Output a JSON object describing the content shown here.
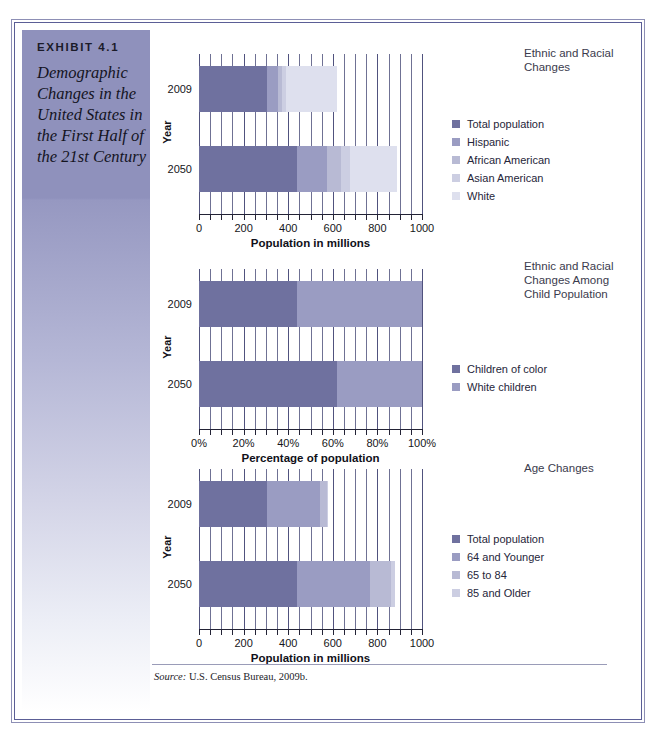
{
  "exhibit": {
    "tag": "EXHIBIT 4.1",
    "title": "Demographic Changes in the United States in the First Half of the 21st Century"
  },
  "source": {
    "prefix": "Source:",
    "text": "U.S. Census Bureau, 2009b."
  },
  "palette": {
    "total_population": "#6f719f",
    "hispanic": "#9a9cc2",
    "african_american": "#b8bad4",
    "asian_american": "#ccceE2",
    "white": "#dee0ee",
    "children_of_color": "#6f719f",
    "white_children": "#9a9cc2",
    "age_64_younger": "#9a9cc2",
    "age_65_84": "#b8bad4",
    "age_85_older": "#ccceE2",
    "frame_outer": "#8d8fb5",
    "frame_inner": "#5b5e96",
    "sidebar_top": "#8f91bc"
  },
  "chart_data": [
    {
      "id": "chart1",
      "type": "bar",
      "orientation": "horizontal",
      "stacked": true,
      "title": "Ethnic and Racial Changes",
      "xlabel": "Population in millions",
      "ylabel": "Year",
      "xlim": [
        0,
        1000
      ],
      "xticks": [
        0,
        200,
        400,
        600,
        800,
        1000
      ],
      "xtick_labels": [
        "0",
        "200",
        "400",
        "600",
        "800",
        "1000"
      ],
      "minor_tick_step": 50,
      "grid": true,
      "categories": [
        "2009",
        "2050"
      ],
      "series": [
        {
          "name": "Total population",
          "color": "#6f719f",
          "values": [
            307,
            439
          ]
        },
        {
          "name": "Hispanic",
          "color": "#9a9cc2",
          "values": [
            47,
            133
          ]
        },
        {
          "name": "African American",
          "color": "#b8bad4",
          "values": [
            20,
            65
          ]
        },
        {
          "name": "Asian American",
          "color": "#ccceE2",
          "values": [
            14,
            40
          ]
        },
        {
          "name": "White",
          "color": "#dee0ee",
          "values": [
            232,
            210
          ]
        }
      ],
      "legend_position": "right"
    },
    {
      "id": "chart2",
      "type": "bar",
      "orientation": "horizontal",
      "stacked": true,
      "title": "Ethnic and Racial Changes Among Child Population",
      "xlabel": "Percentage of population",
      "ylabel": "Year",
      "xlim": [
        0,
        100
      ],
      "xticks": [
        0,
        20,
        40,
        60,
        80,
        100
      ],
      "xtick_labels": [
        "0%",
        "20%",
        "40%",
        "60%",
        "80%",
        "100%"
      ],
      "minor_tick_step": 5,
      "grid": true,
      "categories": [
        "2009",
        "2050"
      ],
      "series": [
        {
          "name": "Children of color",
          "color": "#6f719f",
          "values": [
            44,
            62
          ]
        },
        {
          "name": "White children",
          "color": "#9a9cc2",
          "values": [
            56,
            38
          ]
        }
      ],
      "legend_position": "right"
    },
    {
      "id": "chart3",
      "type": "bar",
      "orientation": "horizontal",
      "stacked": true,
      "title": "Age Changes",
      "xlabel": "Population in millions",
      "ylabel": "Year",
      "xlim": [
        0,
        1000
      ],
      "xticks": [
        0,
        200,
        400,
        600,
        800,
        1000
      ],
      "xtick_labels": [
        "0",
        "200",
        "400",
        "600",
        "800",
        "1000"
      ],
      "minor_tick_step": 50,
      "grid": true,
      "categories": [
        "2009",
        "2050"
      ],
      "series": [
        {
          "name": "Total population",
          "color": "#6f719f",
          "values": [
            307,
            439
          ]
        },
        {
          "name": "64 and Younger",
          "color": "#9a9cc2",
          "values": [
            234,
            330
          ]
        },
        {
          "name": "65 to 84",
          "color": "#b8bad4",
          "values": [
            33,
            90
          ]
        },
        {
          "name": "85 and Older",
          "color": "#ccceE2",
          "values": [
            6,
            20
          ]
        }
      ],
      "legend_position": "right"
    }
  ]
}
